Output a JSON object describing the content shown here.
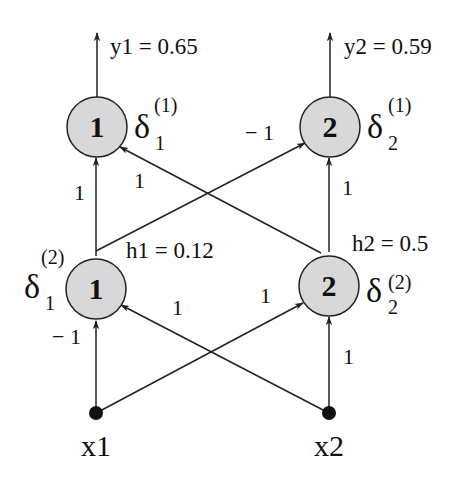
{
  "diagram": {
    "type": "neural-network",
    "colors": {
      "node_fill": "#d8d8d8",
      "node_stroke": "#222222",
      "edge": "#222222",
      "input_dot": "#111111"
    },
    "outputs": [
      {
        "id": "y1",
        "label": "y1 = 0.65",
        "node_number": "1",
        "delta_sym": "δ",
        "delta_sub": "1",
        "delta_sup": "(1)"
      },
      {
        "id": "y2",
        "label": "y2 = 0.59",
        "node_number": "2",
        "delta_sym": "δ",
        "delta_sub": "2",
        "delta_sup": "(1)"
      }
    ],
    "hidden": [
      {
        "id": "h1",
        "label": "h1 = 0.12",
        "node_number": "1",
        "delta_sym": "δ",
        "delta_sub": "1",
        "delta_sup": "(2)"
      },
      {
        "id": "h2",
        "label": "h2 = 0.5",
        "node_number": "2",
        "delta_sym": "δ",
        "delta_sub": "2",
        "delta_sup": "(2)"
      }
    ],
    "inputs": [
      {
        "id": "x1",
        "label": "x1"
      },
      {
        "id": "x2",
        "label": "x2"
      }
    ],
    "weights": {
      "h1_to_o1": "1",
      "h2_to_o1": "1",
      "h1_to_o2": "− 1",
      "h2_to_o2": "1",
      "x1_to_h1": "− 1",
      "x2_to_h1": "1",
      "x1_to_h2": "1",
      "x2_to_h2": "1"
    }
  }
}
